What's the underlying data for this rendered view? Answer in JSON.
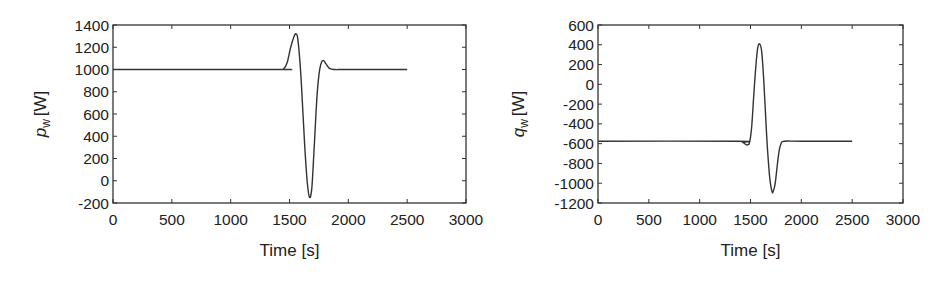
{
  "chart_data": [
    {
      "type": "line",
      "title": "",
      "xlabel": "Time [s]",
      "ylabel": "p_w [W]",
      "ylabel_main": "p",
      "ylabel_sub": "w",
      "ylabel_unit": "[W]",
      "xlim": [
        0,
        3000
      ],
      "ylim": [
        -200,
        1400
      ],
      "xticks": [
        0,
        500,
        1000,
        1500,
        2000,
        2500,
        3000
      ],
      "yticks": [
        -200,
        0,
        200,
        400,
        600,
        800,
        1000,
        1200,
        1400
      ],
      "grid": false,
      "legend": null,
      "frame": {
        "left": 113,
        "top": 25,
        "right": 466,
        "bottom": 203
      },
      "series": [
        {
          "name": "p_w",
          "color": "#333333",
          "x": [
            0,
            1400,
            1450,
            1480,
            1510,
            1540,
            1555,
            1570,
            1590,
            1610,
            1630,
            1650,
            1670,
            1690,
            1710,
            1730,
            1750,
            1770,
            1790,
            1810,
            1840,
            1880,
            2000,
            2500
          ],
          "y": [
            1000,
            1000,
            1005,
            1060,
            1200,
            1300,
            1320,
            1280,
            1050,
            700,
            300,
            0,
            -150,
            -60,
            300,
            700,
            950,
            1060,
            1080,
            1050,
            1010,
            1000,
            1000,
            1000
          ]
        }
      ]
    },
    {
      "type": "line",
      "title": "",
      "xlabel": "Time [s]",
      "ylabel": "q_w [W]",
      "ylabel_main": "q",
      "ylabel_sub": "w",
      "ylabel_unit": "[W]",
      "xlim": [
        0,
        3000
      ],
      "ylim": [
        -1200,
        600
      ],
      "xticks": [
        0,
        500,
        1000,
        1500,
        2000,
        2500,
        3000
      ],
      "yticks": [
        -1200,
        -1000,
        -800,
        -600,
        -400,
        -200,
        0,
        200,
        400,
        600
      ],
      "grid": false,
      "legend": null,
      "frame": {
        "left": 598,
        "top": 25,
        "right": 903,
        "bottom": 203
      },
      "series": [
        {
          "name": "q_w",
          "color": "#333333",
          "x": [
            0,
            1380,
            1420,
            1450,
            1470,
            1490,
            1510,
            1530,
            1550,
            1570,
            1590,
            1610,
            1630,
            1650,
            1670,
            1690,
            1710,
            1720,
            1740,
            1760,
            1780,
            1800,
            1830,
            2000,
            2500
          ],
          "y": [
            -575,
            -575,
            -585,
            -605,
            -612,
            -590,
            -450,
            -150,
            150,
            360,
            410,
            330,
            50,
            -350,
            -700,
            -950,
            -1080,
            -1090,
            -1020,
            -850,
            -680,
            -600,
            -575,
            -575,
            -575
          ]
        }
      ]
    }
  ]
}
